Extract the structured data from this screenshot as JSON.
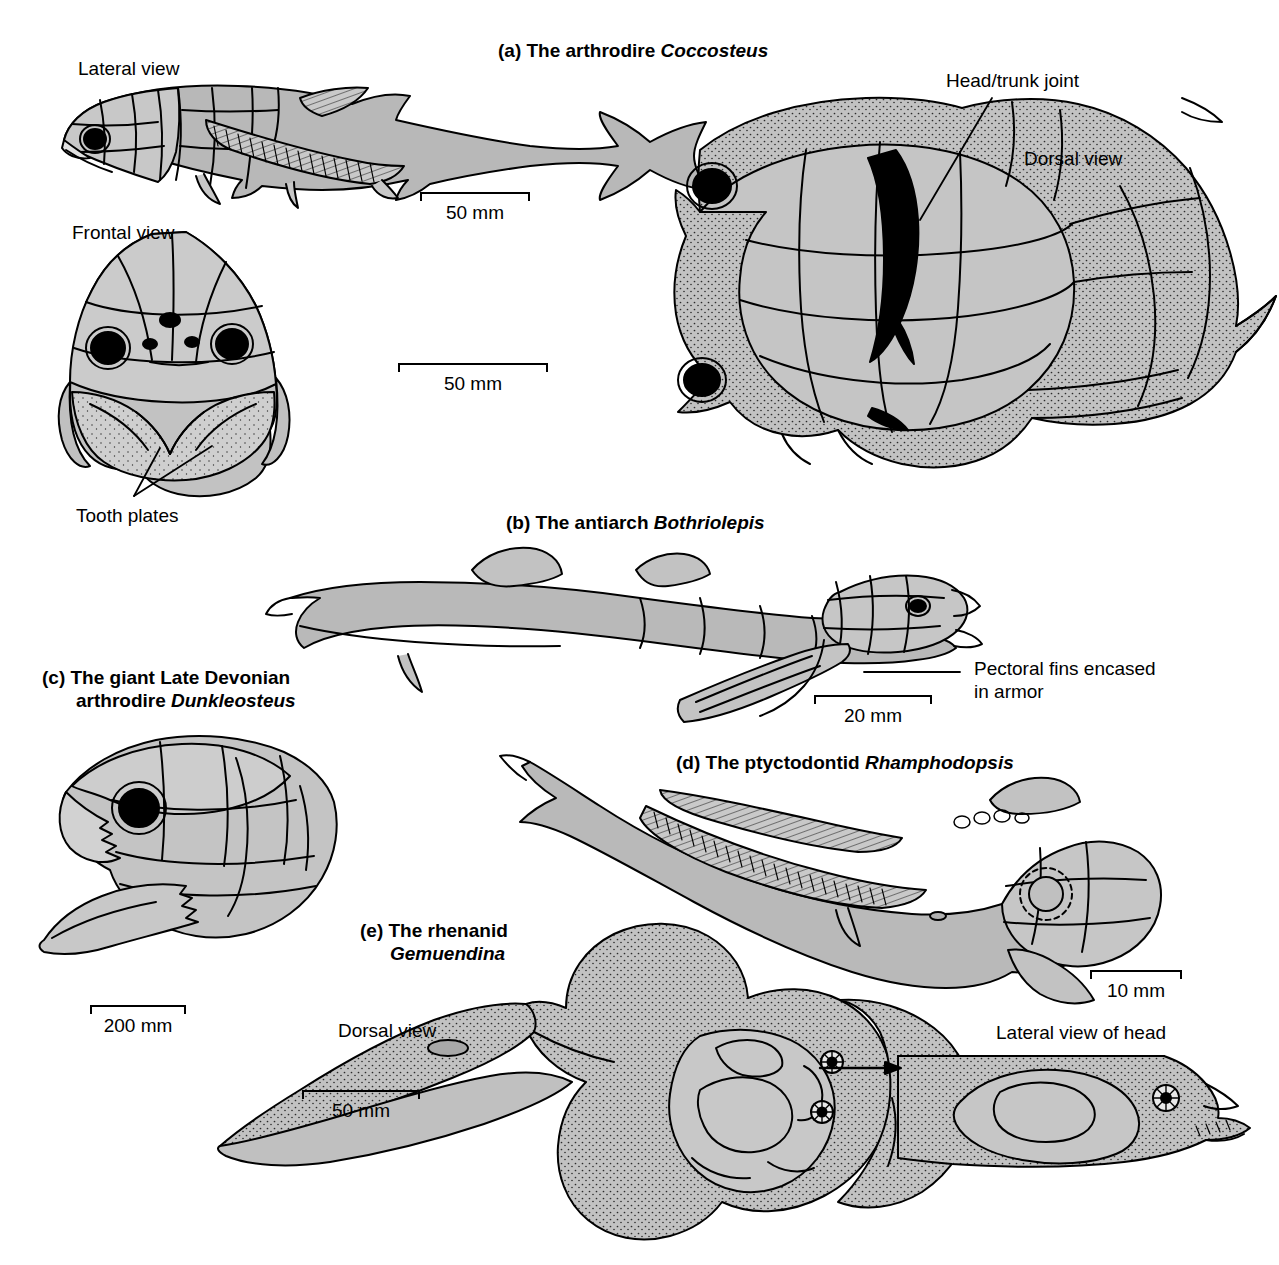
{
  "figure": {
    "type": "scientific-illustration",
    "background_color": "#ffffff",
    "line_color": "#000000",
    "fill_gray": "#b8b8b8",
    "fill_light_gray": "#d8d8d8"
  },
  "panels": [
    {
      "id": "a",
      "prefix": "(a)",
      "text": "The arthrodire ",
      "taxon": "Coccosteus",
      "views": [
        {
          "label": "Lateral view"
        },
        {
          "label": "Frontal view"
        },
        {
          "label": "Dorsal view"
        }
      ],
      "annotations": [
        {
          "label": "Head/trunk joint"
        },
        {
          "label": "Tooth plates"
        }
      ],
      "scale_bars": [
        {
          "value": "50 mm"
        },
        {
          "value": "50 mm"
        }
      ]
    },
    {
      "id": "b",
      "prefix": "(b)",
      "text": "The antiarch ",
      "taxon": "Bothriolepis",
      "annotations": [
        {
          "label_line1": "Pectoral fins encased",
          "label_line2": "in armor"
        }
      ],
      "scale_bars": [
        {
          "value": "20 mm"
        }
      ]
    },
    {
      "id": "c",
      "prefix": "(c)",
      "text_line1": "The giant Late Devonian",
      "text_line2": "arthrodire ",
      "taxon": "Dunkleosteus",
      "scale_bars": [
        {
          "value": "200 mm"
        }
      ]
    },
    {
      "id": "d",
      "prefix": "(d)",
      "text": "The ptyctodontid ",
      "taxon": "Rhamphodopsis",
      "scale_bars": [
        {
          "value": "10 mm"
        }
      ]
    },
    {
      "id": "e",
      "prefix": "(e)",
      "text_line1": "The rhenanid",
      "taxon": "Gemuendina",
      "views": [
        {
          "label": "Dorsal view"
        },
        {
          "label": "Lateral view of head"
        }
      ],
      "scale_bars": [
        {
          "value": "50 mm"
        }
      ]
    }
  ],
  "labels": {
    "a_title_prefix": "(a) The arthrodire ",
    "a_title_taxon": "Coccosteus",
    "a_lateral_view": "Lateral view",
    "a_frontal_view": "Frontal view",
    "a_dorsal_view": "Dorsal view",
    "a_head_trunk_joint": "Head/trunk joint",
    "a_tooth_plates": "Tooth plates",
    "a_scale_lateral": "50 mm",
    "a_scale_dorsal": "50 mm",
    "b_title_prefix": "(b) The antiarch ",
    "b_title_taxon": "Bothriolepis",
    "b_pectoral_1": "Pectoral fins encased",
    "b_pectoral_2": "in armor",
    "b_scale": "20 mm",
    "c_title_line1": "(c) The giant Late Devonian",
    "c_title_line2_prefix": "arthrodire ",
    "c_title_taxon": "Dunkleosteus",
    "c_scale": "200 mm",
    "d_title_prefix": "(d) The ptyctodontid ",
    "d_title_taxon": "Rhamphodopsis",
    "d_scale": "10 mm",
    "e_title_line1": "(e) The rhenanid",
    "e_title_taxon": "Gemuendina",
    "e_dorsal_view": "Dorsal view",
    "e_lateral_head": "Lateral view of head",
    "e_scale": "50 mm"
  }
}
